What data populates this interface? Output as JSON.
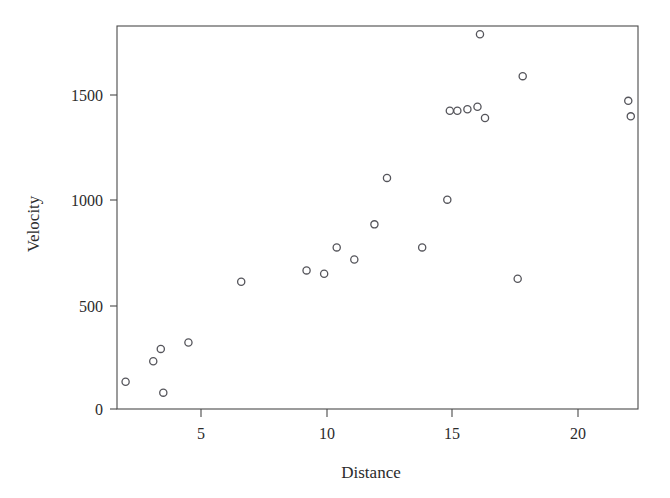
{
  "chart_data": {
    "type": "scatter",
    "title": "",
    "xlabel": "Distance",
    "ylabel": "Velocity",
    "xlim": [
      1.3,
      22.7
    ],
    "ylim": [
      -30,
      1870
    ],
    "xticks": [
      5,
      10,
      15,
      20
    ],
    "yticks": [
      0,
      500,
      1000,
      1500
    ],
    "xtick_labels": [
      "5",
      "10",
      "15",
      "20"
    ],
    "ytick_labels": [
      "0",
      "500",
      "1000",
      "1500"
    ],
    "grid": false,
    "legend": null,
    "marker": "open-circle",
    "marker_color": "#55555b",
    "n_points": 24,
    "x": [
      2.0,
      3.1,
      3.4,
      3.5,
      4.5,
      6.6,
      9.2,
      9.9,
      10.4,
      10.9,
      11.1,
      11.9,
      12.4,
      13.8,
      14.8,
      14.9,
      15.0,
      15.2,
      15.6,
      16.1,
      16.2,
      17.6,
      17.8,
      22.0,
      22.1
    ],
    "y": [
      130,
      228,
      287,
      78,
      318,
      608,
      662,
      646,
      772,
      714,
      714,
      882,
      1104,
      772,
      1000,
      1425,
      1425,
      1432,
      1444,
      1790,
      1390,
      622,
      1590,
      1472,
      1398
    ],
    "points": [
      {
        "x": 2.0,
        "y": 130
      },
      {
        "x": 3.1,
        "y": 228
      },
      {
        "x": 3.4,
        "y": 287
      },
      {
        "x": 3.5,
        "y": 78
      },
      {
        "x": 4.5,
        "y": 318
      },
      {
        "x": 6.6,
        "y": 608
      },
      {
        "x": 9.2,
        "y": 662
      },
      {
        "x": 9.9,
        "y": 646
      },
      {
        "x": 10.4,
        "y": 772
      },
      {
        "x": 11.1,
        "y": 714
      },
      {
        "x": 11.9,
        "y": 882
      },
      {
        "x": 12.4,
        "y": 1104
      },
      {
        "x": 13.8,
        "y": 772
      },
      {
        "x": 14.8,
        "y": 1000
      },
      {
        "x": 14.9,
        "y": 1425
      },
      {
        "x": 15.2,
        "y": 1425
      },
      {
        "x": 15.6,
        "y": 1432
      },
      {
        "x": 16.0,
        "y": 1444
      },
      {
        "x": 16.1,
        "y": 1790
      },
      {
        "x": 16.3,
        "y": 1390
      },
      {
        "x": 17.6,
        "y": 622
      },
      {
        "x": 17.8,
        "y": 1590
      },
      {
        "x": 22.0,
        "y": 1472
      },
      {
        "x": 22.1,
        "y": 1398
      }
    ]
  },
  "axes": {
    "x_title": "Distance",
    "y_title": "Velocity"
  }
}
